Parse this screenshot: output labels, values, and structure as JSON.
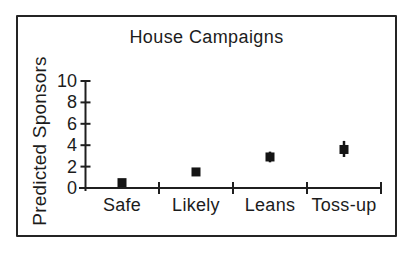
{
  "figure": {
    "background": "#ffffff",
    "border_color": "#242424",
    "axis_color": "#1f1f1f",
    "marker_color": "#141414"
  },
  "chart_data": {
    "type": "scatter",
    "title": "House Campaigns",
    "xlabel": "",
    "ylabel": "Predicted Sponsors",
    "categories": [
      "Safe",
      "Likely",
      "Leans",
      "Toss-up"
    ],
    "values": [
      0.5,
      1.5,
      2.9,
      3.6
    ],
    "error_low": [
      0.5,
      1.5,
      2.4,
      2.9
    ],
    "error_high": [
      0.5,
      1.5,
      3.4,
      4.4
    ],
    "yticks": [
      0,
      2,
      4,
      6,
      8,
      10
    ],
    "ylim": [
      0,
      10
    ],
    "marker": "filled-square",
    "grid": false,
    "legend": "none"
  }
}
